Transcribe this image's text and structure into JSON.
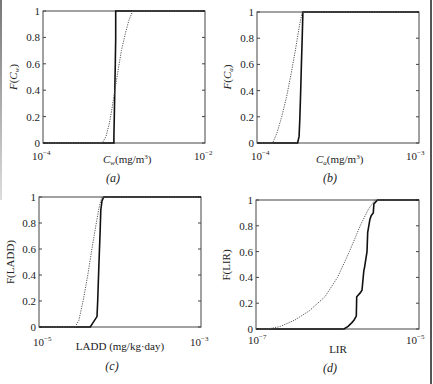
{
  "chart_data": [
    {
      "panel": "(a)",
      "type": "line",
      "title": "",
      "xlabel": "C_w (mg/m^3)",
      "ylabel": "F(C_w)",
      "xscale": "log",
      "xlim": [
        0.0001,
        0.01
      ],
      "ylim": [
        0,
        1
      ],
      "xtick_labels": [
        "10^-4",
        "10^-2"
      ],
      "ytick_labels": [
        "0",
        "0.2",
        "0.4",
        "0.6",
        "0.8",
        "1"
      ],
      "grid": false,
      "series": [
        {
          "name": "solid",
          "style": "solid",
          "x": [
            0.00075,
            0.00075,
            0.00076,
            0.00077,
            0.00078,
            0.00079,
            0.00079,
            0.0011
          ],
          "y": [
            0,
            0.05,
            0.2,
            0.4,
            0.6,
            0.8,
            1.0,
            1.0
          ]
        },
        {
          "name": "dotted",
          "style": "dotted",
          "x": [
            0.00054,
            0.0006,
            0.00066,
            0.00072,
            0.00078,
            0.00085,
            0.00093,
            0.00104,
            0.00115,
            0.00128
          ],
          "y": [
            0,
            0.05,
            0.15,
            0.28,
            0.42,
            0.56,
            0.7,
            0.83,
            0.93,
            1.0
          ]
        }
      ]
    },
    {
      "panel": "(b)",
      "type": "line",
      "title": "",
      "xlabel": "C_a (mg/m^3)",
      "ylabel": "F(C_a)",
      "xscale": "log",
      "xlim": [
        0.0001,
        0.001
      ],
      "ylim": [
        0,
        1
      ],
      "xtick_labels": [
        "10^-4",
        "10^-3"
      ],
      "ytick_labels": [
        "0",
        "0.2",
        "0.4",
        "0.6",
        "0.8",
        "1"
      ],
      "grid": false,
      "series": [
        {
          "name": "solid",
          "style": "solid",
          "x": [
            0.000178,
            0.000182,
            0.000184,
            0.000186,
            0.000188,
            0.00019,
            0.000192
          ],
          "y": [
            0,
            0.05,
            0.2,
            0.4,
            0.6,
            0.8,
            1.0
          ]
        },
        {
          "name": "dotted",
          "style": "dotted",
          "x": [
            0.000125,
            0.000133,
            0.000142,
            0.000152,
            0.000162,
            0.000172,
            0.000182,
            0.00019
          ],
          "y": [
            0,
            0.08,
            0.2,
            0.35,
            0.52,
            0.7,
            0.88,
            1.0
          ]
        }
      ]
    },
    {
      "panel": "(c)",
      "type": "line",
      "title": "",
      "xlabel": "LADD (mg/kg·day)",
      "ylabel": "F(LADD)",
      "xscale": "log",
      "xlim": [
        1e-05,
        0.001
      ],
      "ylim": [
        0,
        1
      ],
      "xtick_labels": [
        "10^-5",
        "10^-3"
      ],
      "ytick_labels": [
        "0",
        "0.2",
        "0.4",
        "0.6",
        "0.8",
        "1"
      ],
      "grid": false,
      "series": [
        {
          "name": "solid",
          "style": "solid",
          "x": [
            4.3e-05,
            4.6e-05,
            5.2e-05,
            5.3e-05,
            5.5e-05,
            5.7e-05,
            5.8e-05,
            6e-05,
            6.3e-05
          ],
          "y": [
            0,
            0.03,
            0.08,
            0.2,
            0.5,
            0.75,
            0.9,
            0.97,
            1.0
          ]
        },
        {
          "name": "dotted",
          "style": "dotted",
          "x": [
            2.8e-05,
            3.1e-05,
            3.5e-05,
            4e-05,
            4.5e-05,
            5.1e-05,
            5.6e-05,
            6e-05
          ],
          "y": [
            0,
            0.05,
            0.2,
            0.4,
            0.6,
            0.8,
            0.94,
            1.0
          ]
        }
      ]
    },
    {
      "panel": "(d)",
      "type": "line",
      "title": "",
      "xlabel": "LIR",
      "ylabel": "F(LIR)",
      "xscale": "log",
      "xlim": [
        1e-07,
        1e-05
      ],
      "ylim": [
        0,
        1
      ],
      "xtick_labels": [
        "10^-7",
        "10^-5"
      ],
      "ytick_labels": [
        "0",
        "0.2",
        "0.4",
        "0.6",
        "0.8",
        "1"
      ],
      "grid": false,
      "series": [
        {
          "name": "solid (stepped)",
          "style": "solid",
          "x": [
            1.2e-06,
            1.35e-06,
            1.5e-06,
            1.6e-06,
            1.7e-06,
            1.72e-06,
            1.9e-06,
            2e-06,
            2.1e-06,
            2.15e-06,
            2.3e-06,
            2.35e-06,
            2.5e-06,
            2.6e-06,
            2.75e-06,
            2.8e-06,
            3.1e-06
          ],
          "y": [
            0,
            0.02,
            0.05,
            0.07,
            0.1,
            0.25,
            0.28,
            0.3,
            0.45,
            0.48,
            0.6,
            0.75,
            0.85,
            0.88,
            0.9,
            0.97,
            1.0
          ]
        },
        {
          "name": "dotted",
          "style": "dotted",
          "x": [
            1.4e-07,
            2e-07,
            3e-07,
            4.5e-07,
            7e-07,
            1e-06,
            1.4e-06,
            1.9e-06,
            2.4e-06,
            2.9e-06
          ],
          "y": [
            0,
            0.02,
            0.07,
            0.14,
            0.25,
            0.4,
            0.6,
            0.8,
            0.93,
            1.0
          ]
        }
      ]
    }
  ],
  "panels": {
    "a": {
      "ylabel_main": "F",
      "ylabel_sub": "w",
      "xlabel_main": "C",
      "xlabel_sub": "w",
      "xlabel_unit": "(mg/m",
      "xlabel_sup": "3",
      "xlabel_close": ")",
      "xmin": "10",
      "xmin_exp": "−4",
      "xmax": "10",
      "xmax_exp": "−2",
      "caption": "(a)"
    },
    "b": {
      "ylabel_main": "F",
      "ylabel_sub": "a",
      "xlabel_main": "C",
      "xlabel_sub": "a",
      "xlabel_unit": "(mg/m",
      "xlabel_sup": "3",
      "xlabel_close": ")",
      "xmin": "10",
      "xmin_exp": "−4",
      "xmax": "10",
      "xmax_exp": "−3",
      "caption": "(b)"
    },
    "c": {
      "ylabel": "F(LADD)",
      "xlabel": "LADD (mg/kg·day)",
      "xmin": "10",
      "xmin_exp": "−5",
      "xmax": "10",
      "xmax_exp": "−3",
      "caption": "(c)"
    },
    "d": {
      "ylabel": "F(LIR)",
      "xlabel": "LIR",
      "xmin": "10",
      "xmin_exp": "−7",
      "xmax": "10",
      "xmax_exp": "−5",
      "caption": "(d)"
    }
  },
  "yticks": [
    "0",
    "0.2",
    "0.4",
    "0.6",
    "0.8",
    "1"
  ]
}
